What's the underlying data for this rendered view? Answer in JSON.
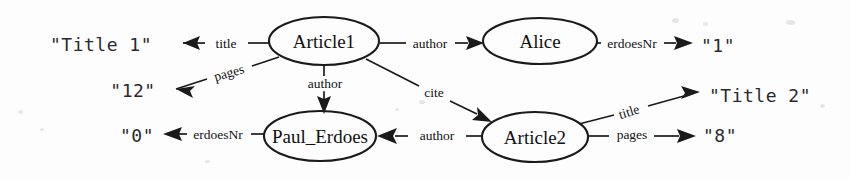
{
  "diagram": {
    "type": "rdf-graph",
    "title": "",
    "nodes": [
      {
        "id": "article1",
        "label": "Article1",
        "kind": "resource",
        "cx": 324,
        "cy": 41,
        "rx": 55,
        "ry": 24
      },
      {
        "id": "alice",
        "label": "Alice",
        "kind": "resource",
        "cx": 540,
        "cy": 41,
        "rx": 57,
        "ry": 23
      },
      {
        "id": "paul",
        "label": "Paul_Erdoes",
        "kind": "resource",
        "cx": 320,
        "cy": 136,
        "rx": 56,
        "ry": 25
      },
      {
        "id": "article2",
        "label": "Article2",
        "kind": "resource",
        "cx": 535,
        "cy": 137,
        "rx": 53,
        "ry": 25
      }
    ],
    "literals": [
      {
        "id": "title1",
        "label": "\"Title 1\"",
        "x": 101,
        "y": 44
      },
      {
        "id": "pages12",
        "label": "\"12\"",
        "x": 133,
        "y": 90
      },
      {
        "id": "erdoes0",
        "label": "\"0\"",
        "x": 137,
        "y": 135
      },
      {
        "id": "erdoes1",
        "label": "\"1\"",
        "x": 718,
        "y": 45
      },
      {
        "id": "title2",
        "label": "\"Title 2\"",
        "x": 760,
        "y": 95
      },
      {
        "id": "pages8",
        "label": "\"8\"",
        "x": 720,
        "y": 135
      }
    ],
    "edges": [
      {
        "id": "e-title1",
        "label": "title",
        "from": "article1",
        "to": "title1",
        "label_x": 226,
        "label_y": 44,
        "rotate": 0
      },
      {
        "id": "e-pages12",
        "label": "pages",
        "from": "article1",
        "to": "pages12",
        "label_x": 229,
        "label_y": 73,
        "rotate": -16
      },
      {
        "id": "e-author-alice",
        "label": "author",
        "from": "article1",
        "to": "alice",
        "label_x": 430,
        "label_y": 44,
        "rotate": 0
      },
      {
        "id": "e-author-paul",
        "label": "author",
        "from": "article1",
        "to": "paul",
        "label_x": 325,
        "label_y": 84,
        "rotate": 0
      },
      {
        "id": "e-cite",
        "label": "cite",
        "from": "article1",
        "to": "article2",
        "label_x": 434,
        "label_y": 93,
        "rotate": 0
      },
      {
        "id": "e-erdoesnr-1",
        "label": "erdoesNr",
        "from": "alice",
        "to": "erdoes1",
        "label_x": 632,
        "label_y": 44,
        "rotate": 0
      },
      {
        "id": "e-erdoesnr-0",
        "label": "erdoesNr",
        "from": "paul",
        "to": "erdoes0",
        "label_x": 218,
        "label_y": 135,
        "rotate": 0
      },
      {
        "id": "e-author-article2",
        "label": "author",
        "from": "article2",
        "to": "paul",
        "label_x": 437,
        "label_y": 136,
        "rotate": 0
      },
      {
        "id": "e-title2",
        "label": "title",
        "from": "article2",
        "to": "title2",
        "label_x": 629,
        "label_y": 112,
        "rotate": -17
      },
      {
        "id": "e-pages8",
        "label": "pages",
        "from": "article2",
        "to": "pages8",
        "label_x": 632,
        "label_y": 135,
        "rotate": 0
      }
    ],
    "colors": {
      "stroke": "#1a1a1a",
      "background": "#fdfdfd",
      "text": "#111111"
    }
  }
}
